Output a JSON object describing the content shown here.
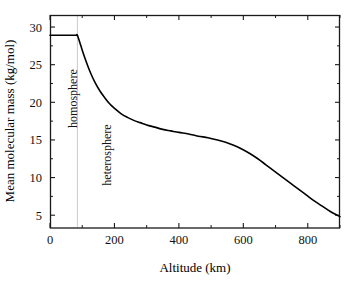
{
  "chart_data": {
    "type": "line",
    "title": "",
    "xlabel": "Altitude (km)",
    "ylabel": "Mean molecular mass (kg/mol)",
    "xlim": [
      0,
      900
    ],
    "ylim": [
      3.3,
      31.6
    ],
    "xticks": [
      0,
      200,
      400,
      600,
      800
    ],
    "xtick_labels": [
      "0",
      "200",
      "400",
      "600",
      "800"
    ],
    "xminor_step": 100,
    "yticks": [
      5,
      10,
      15,
      20,
      25,
      30
    ],
    "ytick_labels": [
      "5",
      "10",
      "15",
      "20",
      "25",
      "30"
    ],
    "yminor_step": 2.5,
    "grid": false,
    "legend": null,
    "line_color": "#000000",
    "line_width": 1.6,
    "series": [
      {
        "name": "Mean molecular mass",
        "x": [
          0,
          20,
          40,
          60,
          80,
          85,
          95,
          105,
          115,
          125,
          140,
          155,
          170,
          185,
          200,
          220,
          240,
          260,
          280,
          300,
          325,
          350,
          375,
          400,
          430,
          460,
          490,
          520,
          545,
          570,
          595,
          620,
          645,
          670,
          695,
          720,
          745,
          770,
          795,
          820,
          845,
          870,
          900
        ],
        "y": [
          28.9,
          28.9,
          28.9,
          28.9,
          28.9,
          28.9,
          27.6,
          26.3,
          25.1,
          24.0,
          22.6,
          21.5,
          20.6,
          19.8,
          19.2,
          18.5,
          18.0,
          17.6,
          17.3,
          17.0,
          16.7,
          16.4,
          16.2,
          16.0,
          15.8,
          15.5,
          15.3,
          15.0,
          14.7,
          14.3,
          13.8,
          13.2,
          12.5,
          11.7,
          10.9,
          10.1,
          9.3,
          8.5,
          7.7,
          6.9,
          6.2,
          5.5,
          4.8
        ]
      }
    ],
    "annotations": [
      {
        "name": "boundary-line",
        "type": "vline",
        "x": 85,
        "color": "#c9c9c9",
        "style": "solid"
      },
      {
        "name": "homosphere-label",
        "type": "text",
        "text": "homosphere",
        "x": 85,
        "y": 20.5,
        "rotation": -90
      },
      {
        "name": "heterosphere-label",
        "type": "text",
        "text": "heterosphere",
        "x": 190,
        "y": 13.0,
        "rotation": -90
      }
    ],
    "frame": {
      "color": "#1a1a1a",
      "left_px": 50,
      "right_px": 340,
      "top_px": 15,
      "bottom_px": 228
    }
  }
}
